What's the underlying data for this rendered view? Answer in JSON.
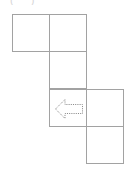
{
  "canvas": {
    "width": 128,
    "height": 176,
    "background": "#ffffff",
    "line_color": "#a2a2a2",
    "arrow_color": "#8d8d8d"
  },
  "top_marks": {
    "text": "( )",
    "color": "#c9c9c9",
    "note": "faint clipped glyphs at top edge"
  },
  "puzzle": {
    "grid_columns": 3,
    "grid_rows": 4,
    "cell_size": 38,
    "cells": [
      {
        "id": "cell-c0-r0",
        "col": 0,
        "row": 0,
        "filled": true,
        "content": ""
      },
      {
        "id": "cell-c1-r0",
        "col": 1,
        "row": 0,
        "filled": true,
        "content": ""
      },
      {
        "id": "cell-c1-r1",
        "col": 1,
        "row": 1,
        "filled": true,
        "content": ""
      },
      {
        "id": "cell-c1-r2",
        "col": 1,
        "row": 2,
        "filled": true,
        "content": "arrow-left"
      },
      {
        "id": "cell-c2-r2",
        "col": 2,
        "row": 2,
        "filled": true,
        "content": ""
      },
      {
        "id": "cell-c2-r3",
        "col": 2,
        "row": 3,
        "filled": true,
        "content": ""
      }
    ],
    "arrow": {
      "direction": "left",
      "style": "hollow-outline-dotted",
      "cell": "cell-c1-r2"
    }
  }
}
